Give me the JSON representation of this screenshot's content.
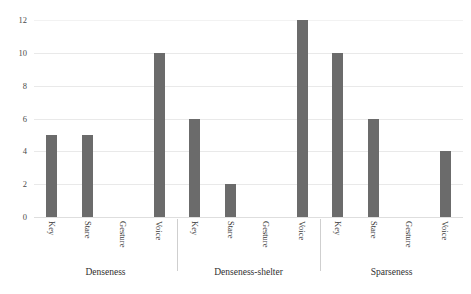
{
  "chart_data": {
    "type": "bar",
    "title": "",
    "xlabel": "",
    "ylabel": "",
    "ylim": [
      0,
      12
    ],
    "ytick_step": 2,
    "yticks": [
      "0",
      "2",
      "4",
      "6",
      "8",
      "10",
      "12"
    ],
    "grid": true,
    "legend": "none",
    "categories": [
      "Key",
      "Stare",
      "Gesture",
      "Voice"
    ],
    "groups": [
      {
        "name": "Denseness",
        "categories": [
          "Key",
          "Stare",
          "Gesture",
          "Voice"
        ],
        "values": [
          5,
          5,
          0,
          10
        ]
      },
      {
        "name": "Denseness-shelter",
        "categories": [
          "Key",
          "Stare",
          "Gesture",
          "Voice"
        ],
        "values": [
          6,
          2,
          0,
          12
        ]
      },
      {
        "name": "Sparseness",
        "categories": [
          "Key",
          "Stare",
          "Gesture",
          "Voice"
        ],
        "values": [
          10,
          6,
          0,
          4
        ]
      }
    ],
    "series": [
      {
        "name": "Denseness",
        "values": [
          5,
          5,
          0,
          10
        ]
      },
      {
        "name": "Denseness-shelter",
        "values": [
          6,
          2,
          0,
          12
        ]
      },
      {
        "name": "Sparseness",
        "values": [
          10,
          6,
          0,
          4
        ]
      }
    ],
    "colors": {
      "bar": "#6b6b6b",
      "gridline": "#e9e9e9",
      "baseline": "#dedede",
      "separator": "#cfcfcf",
      "background": "#ffffff",
      "text": "#3a3a3a"
    }
  }
}
